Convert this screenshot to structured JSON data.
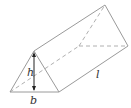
{
  "diagram": {
    "labels": {
      "height": "h",
      "base": "b",
      "length": "l"
    },
    "colors": {
      "edge": "#9a9a9a",
      "hidden_edge": "#b0b0b0",
      "dimension": "#222222",
      "label": "#333333"
    }
  }
}
